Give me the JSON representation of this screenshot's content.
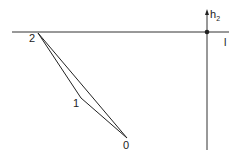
{
  "diagram": {
    "axes": {
      "vertical_label": "h",
      "vertical_label_sub": "2",
      "horizontal_label": "l",
      "origin_marker": "dot"
    },
    "points": [
      {
        "label": "0",
        "x": 127,
        "y": 138
      },
      {
        "label": "1",
        "x": 81,
        "y": 98
      },
      {
        "label": "2",
        "x": 38,
        "y": 33
      }
    ],
    "paths": [
      {
        "from": "2",
        "to": "1"
      },
      {
        "from": "1",
        "to": "0"
      },
      {
        "from": "2",
        "to": "0"
      }
    ],
    "colors": {
      "line": "#222222",
      "background": "#ffffff"
    }
  }
}
